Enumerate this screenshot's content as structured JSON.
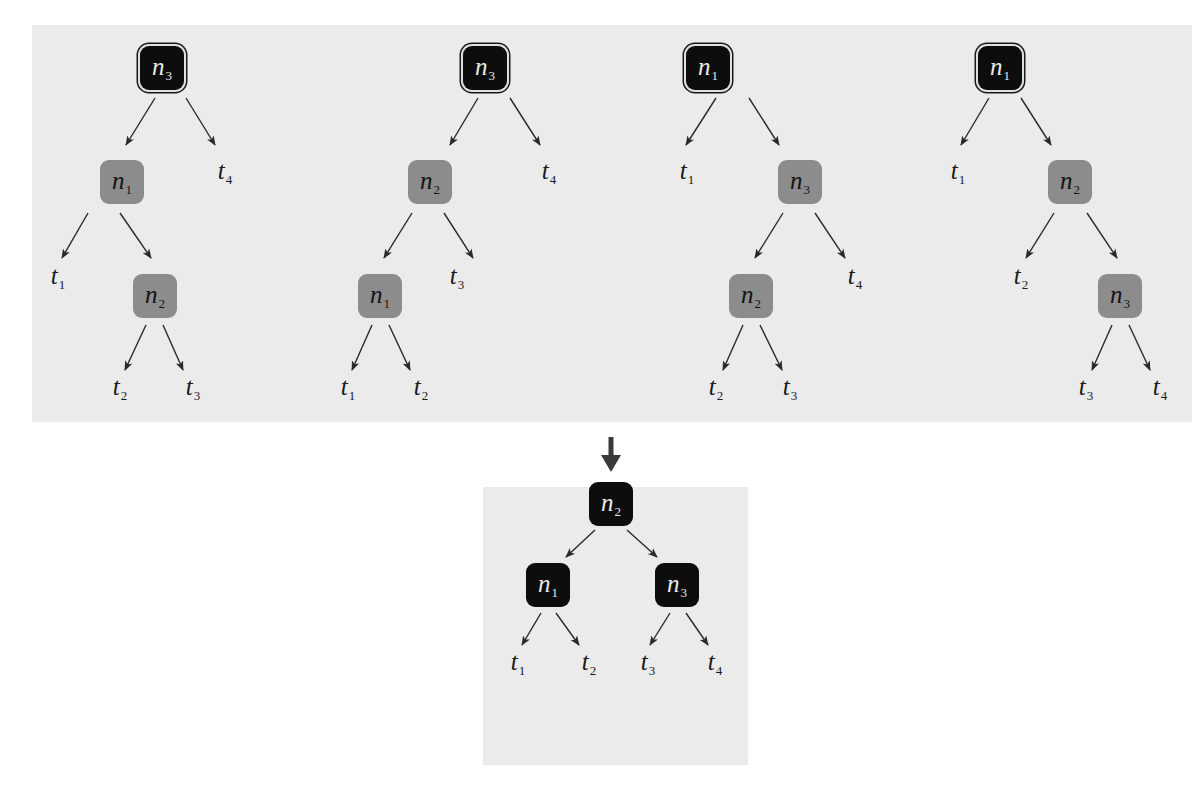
{
  "diagram": {
    "title": "",
    "colors": {
      "panel_bg": "#ebebeb",
      "root_node": "#0d0d0d",
      "internal_node": "#8c8c8c",
      "edge": "#2a2a2a"
    },
    "top_panel": {
      "trees": [
        {
          "nodes": [
            {
              "id": "a_n3",
              "var": "n",
              "sub": "3",
              "kind": "root",
              "x": 162,
              "y": 68
            },
            {
              "id": "a_n1",
              "var": "n",
              "sub": "1",
              "kind": "gray",
              "x": 122,
              "y": 182
            },
            {
              "id": "a_n2",
              "var": "n",
              "sub": "2",
              "kind": "gray",
              "x": 155,
              "y": 296
            }
          ],
          "leaves": [
            {
              "var": "t",
              "sub": "4",
              "x": 225,
              "y": 172
            },
            {
              "var": "t",
              "sub": "1",
              "x": 58,
              "y": 277
            },
            {
              "var": "t",
              "sub": "2",
              "x": 120,
              "y": 388
            },
            {
              "var": "t",
              "sub": "3",
              "x": 193,
              "y": 388
            }
          ],
          "edges": [
            [
              155,
              98,
              126,
              145
            ],
            [
              186,
              98,
              215,
              145
            ],
            [
              88,
              213,
              62,
              258
            ],
            [
              120,
              213,
              151,
              258
            ],
            [
              146,
              325,
              125,
              370
            ],
            [
              163,
              325,
              183,
              370
            ]
          ]
        },
        {
          "nodes": [
            {
              "id": "b_n3",
              "var": "n",
              "sub": "3",
              "kind": "root",
              "x": 485,
              "y": 68
            },
            {
              "id": "b_n2",
              "var": "n",
              "sub": "2",
              "kind": "gray",
              "x": 430,
              "y": 182
            },
            {
              "id": "b_n1",
              "var": "n",
              "sub": "1",
              "kind": "gray",
              "x": 380,
              "y": 296
            }
          ],
          "leaves": [
            {
              "var": "t",
              "sub": "4",
              "x": 549,
              "y": 172
            },
            {
              "var": "t",
              "sub": "3",
              "x": 457,
              "y": 277
            },
            {
              "var": "t",
              "sub": "1",
              "x": 348,
              "y": 388
            },
            {
              "var": "t",
              "sub": "2",
              "x": 421,
              "y": 388
            }
          ],
          "edges": [
            [
              478,
              98,
              450,
              145
            ],
            [
              510,
              98,
              540,
              145
            ],
            [
              412,
              213,
              384,
              258
            ],
            [
              444,
              213,
              473,
              258
            ],
            [
              372,
              325,
              352,
              370
            ],
            [
              389,
              325,
              410,
              370
            ]
          ]
        },
        {
          "nodes": [
            {
              "id": "c_n1",
              "var": "n",
              "sub": "1",
              "kind": "root",
              "x": 708,
              "y": 68
            },
            {
              "id": "c_n3",
              "var": "n",
              "sub": "3",
              "kind": "gray",
              "x": 800,
              "y": 182
            },
            {
              "id": "c_n2",
              "var": "n",
              "sub": "2",
              "kind": "gray",
              "x": 751,
              "y": 296
            }
          ],
          "leaves": [
            {
              "var": "t",
              "sub": "1",
              "x": 687,
              "y": 172
            },
            {
              "var": "t",
              "sub": "4",
              "x": 855,
              "y": 277
            },
            {
              "var": "t",
              "sub": "2",
              "x": 716,
              "y": 388
            },
            {
              "var": "t",
              "sub": "3",
              "x": 790,
              "y": 388
            }
          ],
          "edges": [
            [
              716,
              98,
              686,
              145
            ],
            [
              749,
              98,
              779,
              145
            ],
            [
              783,
              213,
              755,
              258
            ],
            [
              815,
              213,
              845,
              258
            ],
            [
              743,
              325,
              723,
              370
            ],
            [
              760,
              325,
              782,
              370
            ]
          ]
        },
        {
          "nodes": [
            {
              "id": "d_n1",
              "var": "n",
              "sub": "1",
              "kind": "root",
              "x": 1000,
              "y": 68
            },
            {
              "id": "d_n2",
              "var": "n",
              "sub": "2",
              "kind": "gray",
              "x": 1070,
              "y": 182
            },
            {
              "id": "d_n3",
              "var": "n",
              "sub": "3",
              "kind": "gray",
              "x": 1120,
              "y": 296
            }
          ],
          "leaves": [
            {
              "var": "t",
              "sub": "1",
              "x": 958,
              "y": 172
            },
            {
              "var": "t",
              "sub": "2",
              "x": 1021,
              "y": 277
            },
            {
              "var": "t",
              "sub": "3",
              "x": 1086,
              "y": 388
            },
            {
              "var": "t",
              "sub": "4",
              "x": 1160,
              "y": 388
            }
          ],
          "edges": [
            [
              989,
              98,
              961,
              145
            ],
            [
              1021,
              98,
              1051,
              145
            ],
            [
              1054,
              213,
              1026,
              258
            ],
            [
              1087,
              213,
              1117,
              258
            ],
            [
              1112,
              325,
              1092,
              370
            ],
            [
              1129,
              325,
              1150,
              370
            ]
          ]
        }
      ]
    },
    "transition_arrow": {
      "x": 611,
      "y1": 437,
      "y2": 472
    },
    "bottom_panel": {
      "tree": {
        "nodes": [
          {
            "id": "e_n2",
            "var": "n",
            "sub": "2",
            "kind": "black",
            "x": 611,
            "y": 504
          },
          {
            "id": "e_n1",
            "var": "n",
            "sub": "1",
            "kind": "black",
            "x": 548,
            "y": 585
          },
          {
            "id": "e_n3",
            "var": "n",
            "sub": "3",
            "kind": "black",
            "x": 677,
            "y": 585
          }
        ],
        "leaves": [
          {
            "var": "t",
            "sub": "1",
            "x": 518,
            "y": 663
          },
          {
            "var": "t",
            "sub": "2",
            "x": 589,
            "y": 663
          },
          {
            "var": "t",
            "sub": "3",
            "x": 648,
            "y": 663
          },
          {
            "var": "t",
            "sub": "4",
            "x": 715,
            "y": 663
          }
        ],
        "edges": [
          [
            595,
            530,
            566,
            557
          ],
          [
            627,
            530,
            657,
            557
          ],
          [
            541,
            613,
            522,
            645
          ],
          [
            556,
            613,
            579,
            645
          ],
          [
            670,
            613,
            650,
            645
          ],
          [
            686,
            613,
            708,
            645
          ]
        ]
      }
    }
  }
}
